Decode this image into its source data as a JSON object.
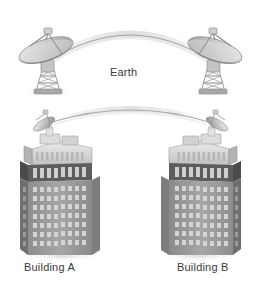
{
  "diagram": {
    "labels": {
      "earth": "Earth",
      "building_a": "Building A",
      "building_b": "Building B"
    },
    "nodes": [
      {
        "id": "dish-left",
        "name": "satellite-dish-left",
        "type": "parabolic-antenna",
        "orientation": "faces-right"
      },
      {
        "id": "dish-right",
        "name": "satellite-dish-right",
        "type": "parabolic-antenna",
        "orientation": "faces-left"
      },
      {
        "id": "building-a",
        "name": "building-a",
        "type": "skyscraper",
        "rooftop_antenna": true
      },
      {
        "id": "building-b",
        "name": "building-b",
        "type": "skyscraper",
        "rooftop_antenna": true
      }
    ],
    "links": [
      {
        "id": "link-upper",
        "from": "dish-left",
        "to": "dish-right",
        "style": "arc",
        "label": "Earth"
      },
      {
        "id": "link-lower",
        "from": "building-a",
        "to": "building-b",
        "style": "arc",
        "label": ""
      }
    ],
    "colors": {
      "background": "#ffffff",
      "label_text": "#3a3a3a",
      "arc_stroke": "#9a9a9a",
      "arc_glow": "#e2e2e2",
      "metal_light": "#e9e9e9",
      "metal_mid": "#bdbdbd",
      "metal_dark": "#8d8d8d",
      "facade_front": "#9c9c9c",
      "facade_side": "#6f6f6f",
      "facade_dark_band": "#5d5d5d",
      "window_light": "#d8d8d8",
      "crown_light": "#dcdcdc",
      "ground_shadow": "#d9d9d9"
    }
  }
}
